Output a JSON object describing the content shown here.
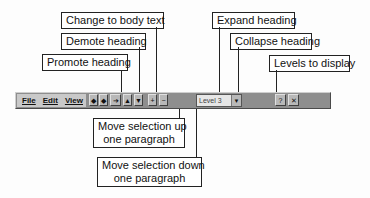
{
  "callouts": {
    "change_to_body_text": "Change to body text",
    "demote_heading": "Demote heading",
    "promote_heading": "Promote heading",
    "expand_heading": "Expand heading",
    "collapse_heading": "Collapse heading",
    "levels_to_display": "Levels to display",
    "move_up_line1": "Move selection up",
    "move_up_line2": "one paragraph",
    "move_down_line1": "Move selection down",
    "move_down_line2": "one paragraph"
  },
  "toolbar": {
    "menu": [
      "File",
      "Edit",
      "View"
    ],
    "buttons": {
      "promote": "◆",
      "demote": "◆",
      "body_text": "➔",
      "move_up": "▲",
      "move_down": "▼",
      "expand": "+",
      "collapse": "−",
      "help": "?",
      "close": "✕"
    },
    "level_value": "Level 3",
    "level_arrow": "▼"
  },
  "colors": {
    "toolbar_bg": "#8e8e8e",
    "button_bg": "#b8b8b8",
    "callout_border": "#222222"
  }
}
